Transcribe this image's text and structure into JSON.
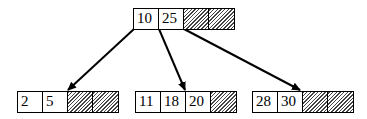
{
  "diagram": {
    "type": "b-tree",
    "colors": {
      "line": "#000000",
      "hatch": "#444444",
      "background": "#ffffff"
    },
    "root": {
      "keys": [
        "10",
        "25"
      ],
      "empty_slots": 2
    },
    "children": [
      {
        "keys": [
          "2",
          "5"
        ],
        "empty_slots": 2
      },
      {
        "keys": [
          "11",
          "18",
          "20"
        ],
        "empty_slots": 1
      },
      {
        "keys": [
          "28",
          "30"
        ],
        "empty_slots": 2
      }
    ],
    "edges": [
      {
        "from": "root.pointer0",
        "to": "children.0"
      },
      {
        "from": "root.pointer1",
        "to": "children.1"
      },
      {
        "from": "root.pointer2",
        "to": "children.2"
      }
    ]
  }
}
